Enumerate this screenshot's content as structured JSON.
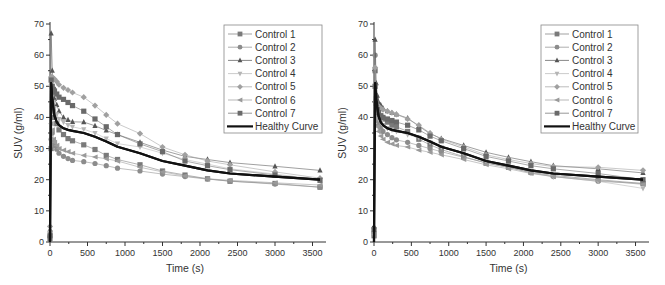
{
  "chart_data": [
    {
      "type": "line",
      "panel": "left",
      "title": "",
      "xlabel": "Time (s)",
      "ylabel": "SUV (g/ml)",
      "xlim": [
        0,
        3600
      ],
      "ylim": [
        0,
        70
      ],
      "xticks": [
        0,
        500,
        1000,
        1500,
        2000,
        2500,
        3000,
        3500
      ],
      "yticks": [
        0,
        10,
        20,
        30,
        40,
        50,
        60,
        70
      ],
      "grid": false,
      "legend_position": "upper right",
      "x": [
        0,
        15,
        30,
        45,
        60,
        90,
        120,
        180,
        240,
        300,
        450,
        600,
        750,
        900,
        1200,
        1500,
        1800,
        2100,
        2400,
        3000,
        3600
      ],
      "series": [
        {
          "name": "Control 1",
          "marker": "square",
          "color": "#7a7a7a",
          "values": [
            1,
            30,
            44,
            42,
            40,
            38,
            36,
            34.5,
            33.2,
            32.5,
            31.2,
            29.7,
            27.8,
            26.5,
            24.8,
            22.8,
            21.5,
            20.3,
            19.5,
            18.8,
            17.6
          ]
        },
        {
          "name": "Control 2",
          "marker": "circle",
          "color": "#8c8c8c",
          "values": [
            2,
            33,
            35,
            32,
            31,
            29.8,
            28.5,
            27.5,
            26.8,
            26.2,
            25.8,
            25.2,
            24.5,
            23.7,
            22.8,
            21.8,
            21,
            20.2,
            19.6,
            18.6,
            17.6
          ]
        },
        {
          "name": "Control 3",
          "marker": "triangle-up",
          "color": "#555555",
          "values": [
            4,
            67,
            55,
            48,
            46,
            44,
            42,
            40,
            39.2,
            38.6,
            38.5,
            37.3,
            35.8,
            34.5,
            32,
            29.5,
            27.5,
            26.5,
            25.5,
            24.3,
            23
          ]
        },
        {
          "name": "Control 4",
          "marker": "triangle-down",
          "color": "#b5b5b5",
          "values": [
            3,
            50,
            48,
            45,
            43,
            41,
            39.5,
            38.5,
            37.5,
            37,
            36.2,
            35,
            33.2,
            31.6,
            30.5,
            28.5,
            26.5,
            25,
            23.5,
            21.8,
            20
          ]
        },
        {
          "name": "Control 5",
          "marker": "diamond",
          "color": "#a0a0a0",
          "values": [
            5,
            53,
            53,
            52.5,
            52.3,
            51.5,
            50.5,
            49.5,
            48.8,
            48,
            46.5,
            43.8,
            40.8,
            38,
            34.8,
            30.5,
            28,
            26,
            24.8,
            22.5,
            20.5
          ]
        },
        {
          "name": "Control 6",
          "marker": "triangle-left",
          "color": "#9a9a9a",
          "values": [
            3,
            38,
            36,
            33,
            32,
            31,
            30,
            29.5,
            29,
            28.5,
            27.8,
            27.3,
            26.7,
            26,
            24,
            22.5,
            21.2,
            20.3,
            19.8,
            19,
            18.3
          ]
        },
        {
          "name": "Control 7",
          "marker": "square",
          "color": "#6a6a6a",
          "values": [
            2,
            52,
            50,
            49,
            48.5,
            47.5,
            46.5,
            45.8,
            44.8,
            43.8,
            42,
            39.5,
            37,
            34.5,
            31.5,
            29,
            26,
            24.5,
            23.2,
            21.5,
            19.8
          ]
        },
        {
          "name": "Healthy Curve",
          "marker": "none",
          "color": "#111111",
          "values": [
            0,
            51,
            46,
            43,
            40.5,
            38.5,
            37.5,
            36.5,
            36,
            35.7,
            35,
            33.8,
            32.3,
            30.6,
            28.5,
            26,
            24.5,
            23,
            22,
            21,
            20
          ]
        }
      ]
    },
    {
      "type": "line",
      "panel": "right",
      "title": "",
      "xlabel": "Time (s)",
      "ylabel": "SUV (g/ml)",
      "xlim": [
        0,
        3600
      ],
      "ylim": [
        0,
        70
      ],
      "xticks": [
        0,
        500,
        1000,
        1500,
        2000,
        2500,
        3000,
        3500
      ],
      "yticks": [
        0,
        10,
        20,
        30,
        40,
        50,
        60,
        70
      ],
      "grid": false,
      "legend_position": "upper right",
      "x": [
        0,
        15,
        30,
        45,
        60,
        90,
        120,
        180,
        240,
        300,
        450,
        600,
        750,
        900,
        1200,
        1500,
        1800,
        2100,
        2400,
        3000,
        3600
      ],
      "series": [
        {
          "name": "Control 1",
          "marker": "square",
          "color": "#7a7a7a",
          "values": [
            2,
            55,
            46,
            43,
            41.5,
            40.5,
            39.5,
            38.5,
            37.5,
            37,
            35.5,
            33,
            31.2,
            29.7,
            27.4,
            25.3,
            24,
            22.4,
            21.4,
            20,
            18.8
          ]
        },
        {
          "name": "Control 2",
          "marker": "circle",
          "color": "#8c8c8c",
          "values": [
            3,
            60,
            42,
            39,
            37.5,
            36.5,
            35.5,
            34.5,
            33.5,
            32.8,
            32,
            31,
            30,
            29,
            27.2,
            25.5,
            24,
            22.2,
            21,
            19.5,
            18.8
          ]
        },
        {
          "name": "Control 3",
          "marker": "triangle-up",
          "color": "#555555",
          "values": [
            5,
            65,
            51,
            47,
            45,
            44,
            43,
            42,
            41.5,
            41,
            39.8,
            37.2,
            34.8,
            33.2,
            31,
            28.8,
            27.2,
            25.8,
            24.5,
            23.5,
            22.2
          ]
        },
        {
          "name": "Control 4",
          "marker": "triangle-down",
          "color": "#b5b5b5",
          "values": [
            2,
            50,
            44,
            41,
            39.5,
            38.5,
            37.5,
            36.5,
            36,
            35.5,
            34.5,
            33.5,
            32,
            30.5,
            28.5,
            26,
            24.5,
            22.5,
            21,
            19.5,
            17.2
          ]
        },
        {
          "name": "Control 5",
          "marker": "diamond",
          "color": "#a0a0a0",
          "values": [
            3,
            56,
            45,
            44,
            43.5,
            43,
            42.5,
            42,
            41.5,
            41,
            39.5,
            37.5,
            35,
            33,
            30.5,
            28,
            26.5,
            25.2,
            24.2,
            24,
            23
          ]
        },
        {
          "name": "Control 6",
          "marker": "triangle-left",
          "color": "#9a9a9a",
          "values": [
            2,
            45,
            40,
            37,
            35.5,
            34,
            33,
            32,
            31.5,
            31,
            30.5,
            29.5,
            28.8,
            28,
            26.5,
            24.8,
            23.5,
            22,
            21,
            19.8,
            18.5
          ]
        },
        {
          "name": "Control 7",
          "marker": "square",
          "color": "#6a6a6a",
          "values": [
            4,
            50,
            44.5,
            42.5,
            41.5,
            40.5,
            40,
            39.5,
            39,
            38.5,
            37.5,
            36,
            34,
            32.5,
            30,
            27.5,
            26,
            24.5,
            23.5,
            22,
            20
          ]
        },
        {
          "name": "Healthy Curve",
          "marker": "none",
          "color": "#111111",
          "values": [
            0,
            51,
            46,
            43,
            40.5,
            38.5,
            37.5,
            36.5,
            36,
            35.7,
            35,
            33.8,
            32.3,
            30.6,
            28.5,
            26,
            24.5,
            23,
            22,
            21,
            20
          ]
        }
      ]
    }
  ],
  "panels": [
    {
      "id": "left",
      "xlabel": "Time (s)",
      "ylabel": "SUV (g/ml)"
    },
    {
      "id": "right",
      "xlabel": "Time (s)",
      "ylabel": "SUV (g/ml)"
    }
  ]
}
